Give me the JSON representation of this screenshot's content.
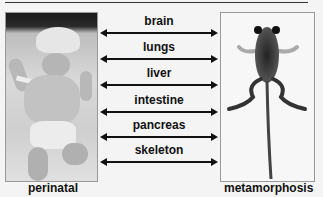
{
  "figure": {
    "left_panel": {
      "caption": "perinatal",
      "image_description": "newborn infant lying on blanket"
    },
    "right_panel": {
      "caption": "metamorphosis",
      "image_description": "tadpole with limbs during metamorphosis (dorsal view)"
    },
    "connections": [
      {
        "label": "brain",
        "arrow": "bidirectional"
      },
      {
        "label": "lungs",
        "arrow": "bidirectional"
      },
      {
        "label": "liver",
        "arrow": "bidirectional"
      },
      {
        "label": "intestine",
        "arrow": "bidirectional"
      },
      {
        "label": "pancreas",
        "arrow": "bidirectional"
      },
      {
        "label": "skeleton",
        "arrow": "bidirectional"
      }
    ],
    "colors": {
      "text": "#111111",
      "arrow": "#111111",
      "background": "#f4f4f4"
    }
  }
}
